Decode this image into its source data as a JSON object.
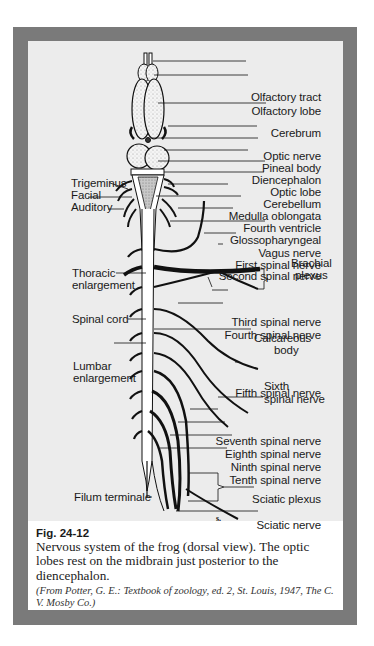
{
  "figure": {
    "number": "Fig. 24-12",
    "caption": "Nervous system of the frog (dorsal view). The optic lobes rest on the midbrain just posterior to the diencephalon.",
    "source": "(From Potter, G. E.: Textbook of zoology, ed. 2, St. Louis, 1947, The C. V. Mosby Co.)",
    "frame_color": "#7a7a7a",
    "drawing_bg": "#ececec"
  },
  "labels_right": [
    {
      "text": "Olfactory tract",
      "y": 56
    },
    {
      "text": "Olfactory lobe",
      "y": 70
    },
    {
      "text": "Cerebrum",
      "y": 92
    },
    {
      "text": "Optic nerve",
      "y": 115
    },
    {
      "text": "Pineal body",
      "y": 127
    },
    {
      "text": "Diencephalon",
      "y": 139
    },
    {
      "text": "Optic lobe",
      "y": 151
    },
    {
      "text": "Cerebellum",
      "y": 163
    },
    {
      "text": "Medulla oblongata",
      "y": 175
    },
    {
      "text": "Fourth ventricle",
      "y": 187
    },
    {
      "text": "Glossopharyngeal",
      "y": 199
    },
    {
      "text": "Vagus nerve",
      "y": 212
    },
    {
      "text": "First spinal nerve",
      "y": 224
    },
    {
      "text": "Second spinal nerve",
      "y": 235
    },
    {
      "text": "Third spinal nerve",
      "y": 281
    },
    {
      "text": "Fourth spinal nerve",
      "y": 294
    },
    {
      "text": "Fifth spinal nerve",
      "y": 352
    },
    {
      "text": "Seventh spinal nerve",
      "y": 400
    },
    {
      "text": "Eighth spinal nerve",
      "y": 413
    },
    {
      "text": "Ninth spinal nerve",
      "y": 426
    },
    {
      "text": "Tenth spinal nerve",
      "y": 439
    },
    {
      "text": "Sciatic plexus",
      "y": 458
    },
    {
      "text": "Sciatic nerve",
      "y": 484
    }
  ],
  "labels_multiline": {
    "brachial_1": "Brachial",
    "brachial_2": "plexus",
    "calcareous_1": "Calcareous",
    "calcareous_2": "body",
    "sixth_1": "Sixth",
    "sixth_2": "spinal nerve"
  },
  "labels_left": {
    "trigeminus": "Trigeminus",
    "facial": "Facial",
    "auditory": "Auditory",
    "thoracic_1": "Thoracic",
    "thoracic_2": "enlargement",
    "spinal_cord": "Spinal cord",
    "lumbar_1": "Lumbar",
    "lumbar_2": "enlargement",
    "filum": "Filum terminale"
  },
  "annotation_s": "s."
}
